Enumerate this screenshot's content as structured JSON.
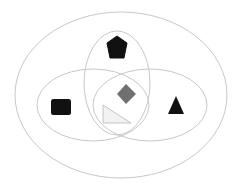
{
  "diagram": {
    "type": "venn",
    "background": "#ffffff",
    "stroke_color": "#c8c8c8",
    "sets": [
      {
        "id": "outer",
        "cx": 121,
        "cy": 95,
        "rx": 106,
        "ry": 83
      },
      {
        "id": "top",
        "cx": 117,
        "cy": 83,
        "rx": 33,
        "ry": 52
      },
      {
        "id": "left",
        "cx": 93,
        "cy": 105,
        "rx": 56,
        "ry": 36
      },
      {
        "id": "right",
        "cx": 150,
        "cy": 105,
        "rx": 57,
        "ry": 36
      }
    ],
    "shapes": [
      {
        "name": "pentagon",
        "color": "#111111",
        "region": "top only"
      },
      {
        "name": "rounded-square",
        "color": "#111111",
        "region": "left only"
      },
      {
        "name": "triangle",
        "color": "#111111",
        "region": "right only"
      },
      {
        "name": "diamond",
        "color": "#707070",
        "region": "top ∩ left ∩ right"
      },
      {
        "name": "right-triangle",
        "color": "#f0f0f0",
        "outline": "#b0b0b0",
        "region": "left ∩ right (top ∩ left ∩ right)"
      }
    ]
  }
}
